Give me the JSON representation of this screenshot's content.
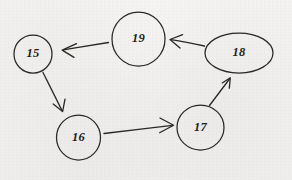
{
  "diagram": {
    "type": "directed-graph",
    "background_color": "#f4f3f1",
    "stroke_color": "#2a2724",
    "nodes": [
      {
        "id": "15",
        "label": "15",
        "shape": "circle",
        "cx": 33,
        "cy": 54,
        "rx": 19,
        "ry": 19
      },
      {
        "id": "19",
        "label": "19",
        "shape": "circle",
        "cx": 138.5,
        "cy": 39,
        "rx": 26.5,
        "ry": 27
      },
      {
        "id": "18",
        "label": "18",
        "shape": "ellipse",
        "cx": 239,
        "cy": 53,
        "rx": 34,
        "ry": 20
      },
      {
        "id": "16",
        "label": "16",
        "shape": "circle",
        "cx": 78.5,
        "cy": 137.5,
        "rx": 22,
        "ry": 22.5
      },
      {
        "id": "17",
        "label": "17",
        "shape": "circle",
        "cx": 200.5,
        "cy": 127.5,
        "rx": 23.5,
        "ry": 22.5
      }
    ],
    "edges": [
      {
        "id": "e19-15",
        "from": "19",
        "to": "15",
        "direction": "right-to-left",
        "label": ""
      },
      {
        "id": "e18-19",
        "from": "18",
        "to": "19",
        "direction": "right-to-left",
        "label": ""
      },
      {
        "id": "e15-16",
        "from": "15",
        "to": "16",
        "direction": "down-right",
        "label": ""
      },
      {
        "id": "e16-17",
        "from": "16",
        "to": "17",
        "direction": "left-to-right",
        "label": ""
      },
      {
        "id": "e17-18",
        "from": "17",
        "to": "18",
        "direction": "up-right",
        "label": ""
      }
    ]
  }
}
